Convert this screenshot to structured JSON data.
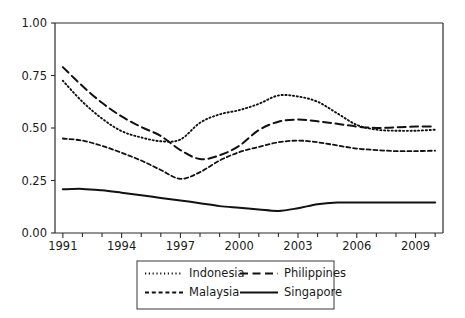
{
  "chart_data": {
    "type": "line",
    "title": "",
    "subtitle": "",
    "xlabel": "",
    "ylabel": "",
    "xlim": [
      1990.6,
      2010.4
    ],
    "ylim": [
      0.0,
      1.0
    ],
    "grid": false,
    "legend_position": "bottom-center",
    "y_ticks": [
      0.0,
      0.25,
      0.5,
      0.75,
      1.0
    ],
    "y_tick_labels": [
      "0.00",
      "0.25",
      "0.50",
      "0.75",
      "1.00"
    ],
    "x_ticks": [
      1991,
      1994,
      1997,
      2000,
      2003,
      2006,
      2009
    ],
    "x_tick_labels": [
      "1991",
      "1994",
      "1997",
      "2000",
      "2003",
      "2006",
      "2009"
    ],
    "x_minor_ticks": [
      1992,
      1993,
      1995,
      1996,
      1998,
      1999,
      2001,
      2002,
      2004,
      2005,
      2007,
      2008,
      2010
    ],
    "x": [
      1991,
      1992,
      1993,
      1994,
      1995,
      1996,
      1997,
      1998,
      1999,
      2000,
      2001,
      2002,
      2003,
      2004,
      2005,
      2006,
      2007,
      2008,
      2009,
      2010
    ],
    "series": [
      {
        "name": "Indonesia",
        "style": "dotted",
        "values": [
          0.725,
          0.625,
          0.545,
          0.485,
          0.455,
          0.437,
          0.445,
          0.525,
          0.565,
          0.585,
          0.615,
          0.655,
          0.65,
          0.625,
          0.57,
          0.515,
          0.492,
          0.487,
          0.487,
          0.492
        ]
      },
      {
        "name": "Philippines",
        "style": "long-dash",
        "values": [
          0.79,
          0.7,
          0.62,
          0.555,
          0.505,
          0.462,
          0.395,
          0.352,
          0.37,
          0.415,
          0.49,
          0.53,
          0.54,
          0.532,
          0.52,
          0.507,
          0.5,
          0.503,
          0.507,
          0.507
        ]
      },
      {
        "name": "Malaysia",
        "style": "short-dash",
        "values": [
          0.45,
          0.44,
          0.415,
          0.382,
          0.345,
          0.3,
          0.258,
          0.29,
          0.345,
          0.385,
          0.41,
          0.432,
          0.44,
          0.432,
          0.417,
          0.402,
          0.395,
          0.39,
          0.39,
          0.392
        ]
      },
      {
        "name": "Singapore",
        "style": "solid",
        "values": [
          0.208,
          0.21,
          0.203,
          0.192,
          0.18,
          0.167,
          0.155,
          0.142,
          0.128,
          0.12,
          0.112,
          0.105,
          0.118,
          0.137,
          0.145,
          0.145,
          0.145,
          0.145,
          0.145,
          0.145
        ]
      }
    ]
  },
  "legend": {
    "entries": [
      {
        "label": "Indonesia",
        "style": "dotted"
      },
      {
        "label": "Philippines",
        "style": "long-dash"
      },
      {
        "label": "Malaysia",
        "style": "short-dash"
      },
      {
        "label": "Singapore",
        "style": "solid"
      }
    ]
  },
  "colors": {
    "line": "#111111",
    "axis": "#2b2b2b",
    "text": "#1a1a1a",
    "background": "#ffffff"
  }
}
